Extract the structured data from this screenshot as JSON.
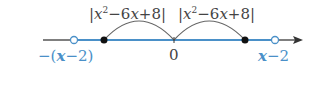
{
  "diagram": {
    "type": "number-line",
    "top_labels": [
      {
        "prefix": "|",
        "var": "x",
        "exp": "2",
        "rest": "−6",
        "var2": "x",
        "tail": "+8|"
      },
      {
        "prefix": "|",
        "var": "x",
        "exp": "2",
        "rest": "−6",
        "var2": "x",
        "tail": "+8|"
      }
    ],
    "origin_label": "0",
    "left_label": {
      "pre": "−(",
      "var": "x",
      "post": "−2)"
    },
    "right_label": {
      "var": "x",
      "post": "−2"
    },
    "colors": {
      "axis": "#555555",
      "highlight": "#4a90c8",
      "arc": "#666666",
      "point": "#111111"
    }
  }
}
